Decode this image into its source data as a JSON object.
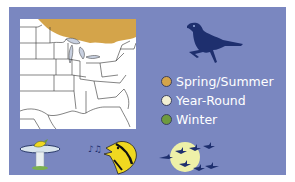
{
  "range_map": {
    "region": "Eastern United States",
    "colors": {
      "panel_bg": "#7a87c0",
      "map_bg": "#ffffff",
      "state_lines": "#333333"
    }
  },
  "legend": {
    "items": [
      {
        "label": "Spring/Summer",
        "color": "#d4a44a"
      },
      {
        "label": "Year-Round",
        "color": "#f2efd2"
      },
      {
        "label": "Winter",
        "color": "#6e9a3e"
      }
    ]
  },
  "icons": {
    "bird_silhouette": "bird-silhouette-icon",
    "bird_bath": "bird-bath-icon",
    "singing_bird": "singing-bird-icon",
    "migration": "migration-moon-icon"
  },
  "colors": {
    "silhouette": "#1e2f6e",
    "moon": "#eef0a8",
    "yellow_bird": "#f0d820"
  }
}
